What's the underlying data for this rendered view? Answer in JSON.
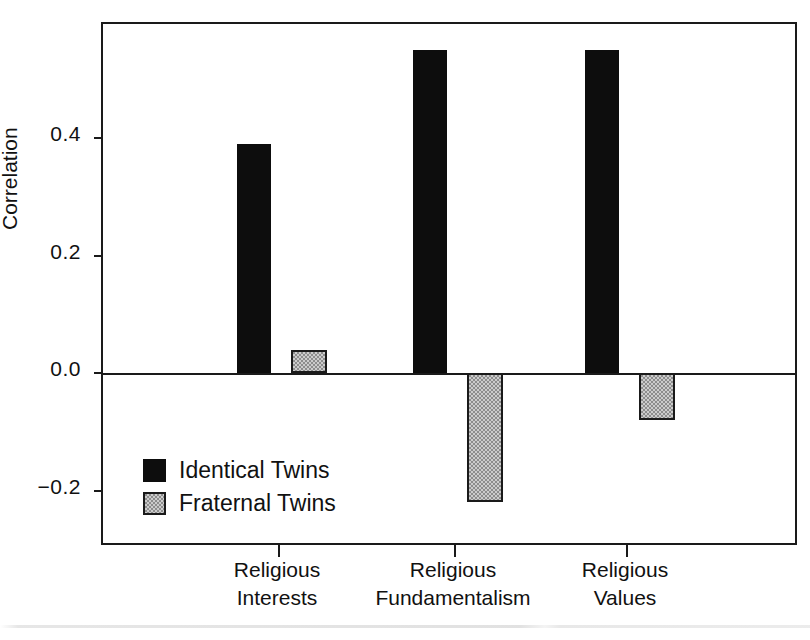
{
  "chart_data": {
    "type": "bar",
    "title": "",
    "xlabel": "",
    "ylabel": "Correlation",
    "categories": [
      "Religious Interests",
      "Religious Fundamentalism",
      "Religious Values"
    ],
    "category_lines": [
      [
        "Religious",
        "Interests"
      ],
      [
        "Religious",
        "Fundamentalism"
      ],
      [
        "Religious",
        "Values"
      ]
    ],
    "series": [
      {
        "name": "Identical Twins",
        "color": "#0d0d0d",
        "fill": "solid-black",
        "values": [
          0.39,
          0.55,
          0.55
        ]
      },
      {
        "name": "Fraternal Twins",
        "color": "#8d8d8d",
        "fill": "gray-checker",
        "values": [
          0.04,
          -0.22,
          -0.08
        ]
      }
    ],
    "yticks": [
      -0.2,
      0.0,
      0.2,
      0.4
    ],
    "ytick_labels": [
      "−0.2",
      "0.0",
      "0.2",
      "0.4"
    ],
    "ylim": [
      -0.275,
      0.615
    ],
    "grid": false,
    "legend_position": "lower-left-inside",
    "zero_line": true
  },
  "legend": {
    "items": [
      {
        "label": "Identical Twins",
        "swatch": "solid-black-swatch"
      },
      {
        "label": "Fraternal Twins",
        "swatch": "gray-checker-swatch"
      }
    ]
  }
}
